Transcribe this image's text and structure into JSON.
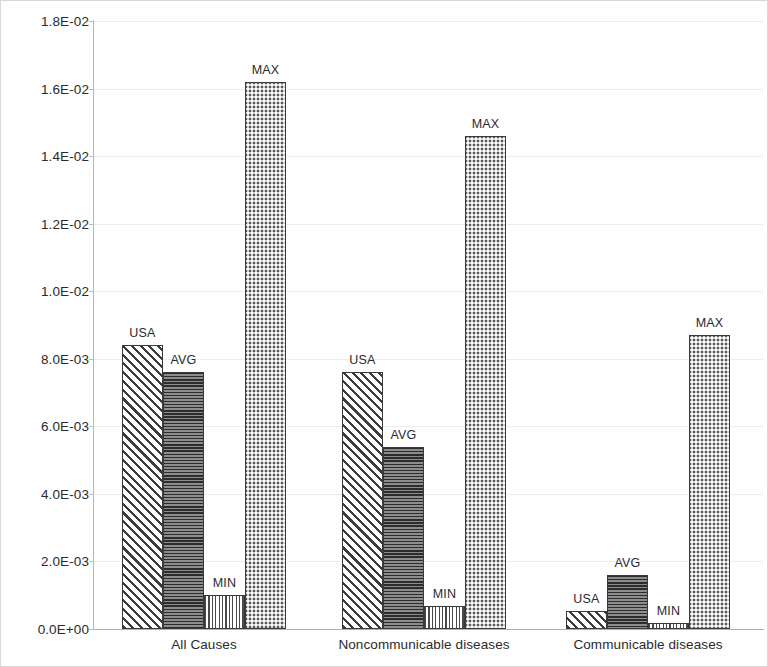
{
  "chart_data": {
    "type": "bar",
    "title": "",
    "subtitle": "",
    "xlabel": "",
    "ylabel": "",
    "categories": [
      "All Causes",
      "Noncommunicable diseases",
      "Communicable diseases"
    ],
    "series": [
      {
        "name": "USA",
        "values": [
          0.0084,
          0.0076,
          0.00053
        ]
      },
      {
        "name": "AVG",
        "values": [
          0.0076,
          0.0054,
          0.0016
        ]
      },
      {
        "name": "MIN",
        "values": [
          0.001,
          0.00068,
          0.00018
        ]
      },
      {
        "name": "MAX",
        "values": [
          0.0162,
          0.0146,
          0.0087
        ]
      }
    ],
    "ylim": [
      0.0,
      0.018
    ],
    "ytick_values": [
      0.0,
      0.002,
      0.004,
      0.006,
      0.008,
      0.01,
      0.012,
      0.014,
      0.016,
      0.018
    ],
    "ytick_labels": [
      "0.0E+00",
      "2.0E-03",
      "4.0E-03",
      "6.0E-03",
      "8.0E-03",
      "1.0E-02",
      "1.2E-02",
      "1.4E-02",
      "1.6E-02",
      "1.8E-02"
    ],
    "grid": true,
    "grid_axis": "y",
    "legend": false,
    "legend_position": "none",
    "bar_labels": [
      [
        "USA",
        "AVG",
        "MIN",
        "MAX"
      ],
      [
        "USA",
        "AVG",
        "MIN",
        "MAX"
      ],
      [
        "USA",
        "AVG",
        "MIN",
        "MAX"
      ]
    ],
    "bar_patterns": [
      "diagonal-hatch",
      "horizontal-lines",
      "vertical-grid",
      "stipple-dots"
    ],
    "colors": {
      "axis": "#b7b7b7",
      "grid": "#ededed",
      "bar_outline": "#3a3a3a",
      "text": "#2b2b2b",
      "background": "#ffffff"
    }
  },
  "axis": {
    "y_labels": [
      "1.8E-02",
      "1.6E-02",
      "1.4E-02",
      "1.2E-02",
      "1.0E-02",
      "8.0E-03",
      "6.0E-03",
      "4.0E-03",
      "2.0E-03",
      "0.0E+00"
    ]
  },
  "categories": {
    "c0": "All Causes",
    "c1": "Noncommunicable diseases",
    "c2": "Communicable diseases"
  },
  "labels": {
    "usa": "USA",
    "avg": "AVG",
    "min": "MIN",
    "max": "MAX"
  }
}
